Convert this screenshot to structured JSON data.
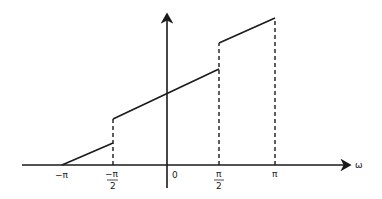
{
  "diagram": {
    "axis_label_x": "ω",
    "ticks": [
      {
        "key": "neg_pi",
        "label": "−π"
      },
      {
        "key": "neg_pi_half_num",
        "label": "−π"
      },
      {
        "key": "neg_pi_half_den",
        "label": "2"
      },
      {
        "key": "zero",
        "label": "0"
      },
      {
        "key": "pi_half_num",
        "label": "π"
      },
      {
        "key": "pi_half_den",
        "label": "2"
      },
      {
        "key": "pi",
        "label": "π"
      }
    ],
    "segments": [
      {
        "from": "-π",
        "to": "-π/2",
        "description": "ramp from zero rising linearly"
      },
      {
        "from": "-π/2",
        "to": "π/2",
        "description": "linear segment after jump up at -π/2"
      },
      {
        "from": "π/2",
        "to": "π",
        "description": "linear segment after jump up at π/2"
      }
    ],
    "colors": {
      "line": "#1a1a1a",
      "background": "#ffffff"
    }
  }
}
